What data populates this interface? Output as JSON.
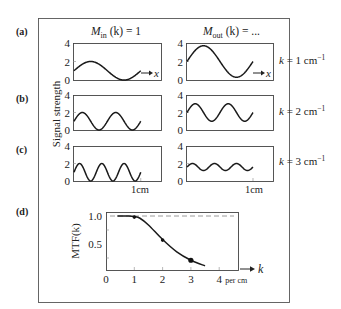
{
  "figure": {
    "panel_labels": [
      "(a)",
      "(b)",
      "(c)",
      "(d)"
    ],
    "col_titles": {
      "input": {
        "main": "M",
        "sub": "in",
        "rest": " (k) = 1"
      },
      "output": {
        "main": "M",
        "sub": "out",
        "rest": " (k) = ..."
      }
    },
    "y_axis_label": "Signal strength",
    "y_ticks": [
      "0",
      "2",
      "4"
    ],
    "x_axis_symbol": "x",
    "scale_label": "1cm",
    "row_labels": [
      {
        "prefix": "k",
        "text": " = 1 cm",
        "sup": "−1"
      },
      {
        "prefix": "k",
        "text": " = 2 cm",
        "sup": "−1"
      },
      {
        "prefix": "k",
        "text": " = 3 cm",
        "sup": "−1"
      }
    ],
    "colors": {
      "curve": "#1a1a1a",
      "frame": "#555555",
      "dashed_ref": "#9a9a9a"
    }
  },
  "chart_data": [
    {
      "type": "line",
      "title": "Input signals, M_in(k) = 1",
      "xlabel": "x (cm)",
      "ylabel": "Signal strength",
      "ylim": [
        0,
        4
      ],
      "series": [
        {
          "name": "k = 1 cm^-1",
          "k": 1,
          "mean": 1.0,
          "amplitude": 1.0,
          "cycles": 1
        },
        {
          "name": "k = 2 cm^-1",
          "k": 2,
          "mean": 1.0,
          "amplitude": 1.0,
          "cycles": 2
        },
        {
          "name": "k = 3 cm^-1",
          "k": 3,
          "mean": 1.0,
          "amplitude": 1.0,
          "cycles": 3
        }
      ]
    },
    {
      "type": "line",
      "title": "Output signals, M_out(k) = ...",
      "xlabel": "x (cm)",
      "ylabel": "Signal strength",
      "ylim": [
        0,
        4
      ],
      "series": [
        {
          "name": "k = 1 cm^-1",
          "k": 1,
          "mean": 2.0,
          "amplitude": 1.7,
          "cycles": 1
        },
        {
          "name": "k = 2 cm^-1",
          "k": 2,
          "mean": 2.0,
          "amplitude": 1.0,
          "cycles": 2
        },
        {
          "name": "k = 3 cm^-1",
          "k": 3,
          "mean": 1.6,
          "amplitude": 0.4,
          "cycles": 3
        }
      ]
    },
    {
      "type": "line",
      "title": "(d) Modulation transfer function",
      "xlabel": "k (per cm)",
      "ylabel": "MTF(k)",
      "xlim": [
        0,
        4.7
      ],
      "ylim": [
        0,
        1.05
      ],
      "x_ticks": [
        "0",
        "1",
        "2",
        "3",
        "4"
      ],
      "x_tick_suffix": "per cm",
      "y_ticks": [
        "0.5",
        "1.0"
      ],
      "reference_line": {
        "y": 1.0,
        "style": "dashed"
      },
      "curve": {
        "x": [
          0.4,
          0.8,
          1.0,
          1.2,
          1.5,
          2.0,
          2.5,
          3.0,
          3.5
        ],
        "y": [
          1.0,
          1.0,
          0.99,
          0.96,
          0.84,
          0.58,
          0.36,
          0.21,
          0.11
        ]
      },
      "points": {
        "x": [
          1,
          2,
          3
        ],
        "y": [
          0.98,
          0.57,
          0.21
        ]
      },
      "axis_symbol": "k"
    }
  ]
}
